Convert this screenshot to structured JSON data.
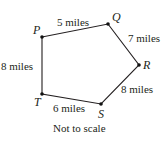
{
  "figure": {
    "caption": "Not to scale",
    "vertices": [
      {
        "id": "P",
        "label": "P",
        "x": 42,
        "y": 37
      },
      {
        "id": "Q",
        "label": "Q",
        "x": 108,
        "y": 24
      },
      {
        "id": "R",
        "label": "R",
        "x": 139,
        "y": 65
      },
      {
        "id": "S",
        "label": "S",
        "x": 101,
        "y": 104
      },
      {
        "id": "T",
        "label": "T",
        "x": 42,
        "y": 94
      }
    ],
    "edges": [
      {
        "from": "P",
        "to": "Q",
        "label": "5 miles"
      },
      {
        "from": "Q",
        "to": "R",
        "label": "7 miles"
      },
      {
        "from": "R",
        "to": "S",
        "label": "8 miles"
      },
      {
        "from": "S",
        "to": "T",
        "label": "6 miles"
      },
      {
        "from": "T",
        "to": "P",
        "label": "8 miles"
      }
    ],
    "colors": {
      "ink": "#231f20",
      "background": "#ffffff"
    }
  }
}
